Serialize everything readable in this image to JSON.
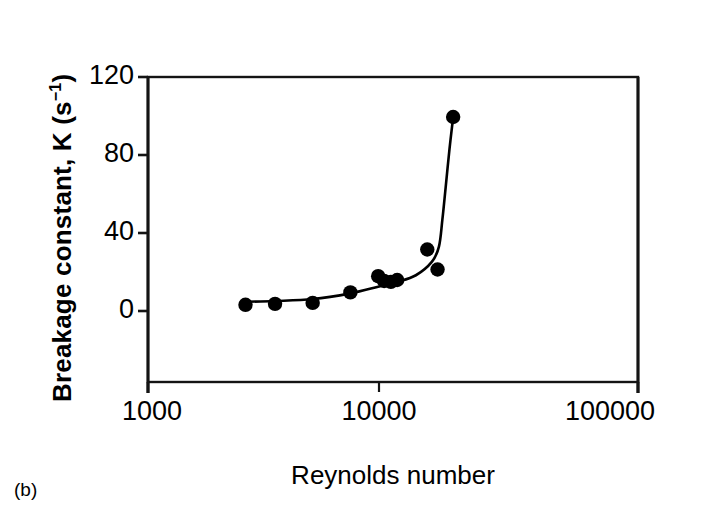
{
  "figure": {
    "panel_label": "(b)"
  },
  "chart_data": {
    "type": "scatter",
    "title": "",
    "subtitle": "",
    "xlabel": "Reynolds number",
    "ylabel": "Breakage constant, K (s−1)",
    "ylabel_base": "Breakage constant, K (s",
    "ylabel_exponent": "−1",
    "ylabel_tail": ")",
    "xscale": "log",
    "yscale": "linear",
    "xlim": [
      1000,
      100000
    ],
    "ylim": [
      -40,
      120
    ],
    "grid": false,
    "legend": null,
    "xticks": [
      1000,
      10000,
      100000
    ],
    "xtick_labels": [
      "1000",
      "10000",
      "100000"
    ],
    "yticks": [
      0,
      40,
      80,
      120
    ],
    "ytick_labels": [
      "0",
      "40",
      "80",
      "120"
    ],
    "marker": "filled-circle",
    "marker_color": "#000000",
    "line_color": "#000000",
    "series": [
      {
        "name": "Breakage constant data",
        "x": [
          2500,
          3300,
          4700,
          6700,
          8700,
          9200,
          9800,
          10400,
          13800,
          15200,
          17600
        ],
        "y": [
          0.5,
          1.0,
          1.5,
          7.0,
          15.5,
          13.0,
          12.5,
          13.5,
          29.5,
          19.0,
          99.0
        ]
      }
    ],
    "fit_line": {
      "name": "trend curve",
      "x": [
        2400,
        3300,
        4700,
        6700,
        8700,
        10400,
        12400,
        14400,
        15400,
        15900,
        16400,
        17000,
        17600
      ],
      "y": [
        2.0,
        2.5,
        3.5,
        6.5,
        10.0,
        12.5,
        16.0,
        23.0,
        31.0,
        45.0,
        62.0,
        82.0,
        99.0
      ]
    },
    "axis_color": "#111111",
    "background": "#ffffff"
  }
}
